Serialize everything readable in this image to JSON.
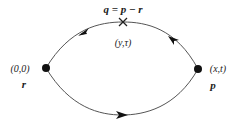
{
  "diagram": {
    "type": "feynman-loop",
    "labels": {
      "top_momentum": "q = p − r",
      "top_vertex_coords": "(y,τ)",
      "left_vertex_coords": "(0,0)",
      "left_momentum": "r",
      "right_vertex_coords": "(x,t)",
      "right_momentum": "p"
    },
    "vertices": [
      {
        "name": "left",
        "x": 46,
        "y": 68
      },
      {
        "name": "right",
        "x": 198,
        "y": 69
      }
    ],
    "insertion_mark": {
      "symbol": "×",
      "x": 123,
      "y": 22
    },
    "arrows": [
      {
        "on": "upper-left-arc",
        "direction": "toward-left-vertex"
      },
      {
        "on": "upper-right-arc",
        "direction": "toward-insertion"
      },
      {
        "on": "lower-arc",
        "direction": "toward-right-vertex"
      }
    ],
    "colors": {
      "line": "#555555",
      "vertex": "#111111",
      "text": "#222222"
    }
  }
}
